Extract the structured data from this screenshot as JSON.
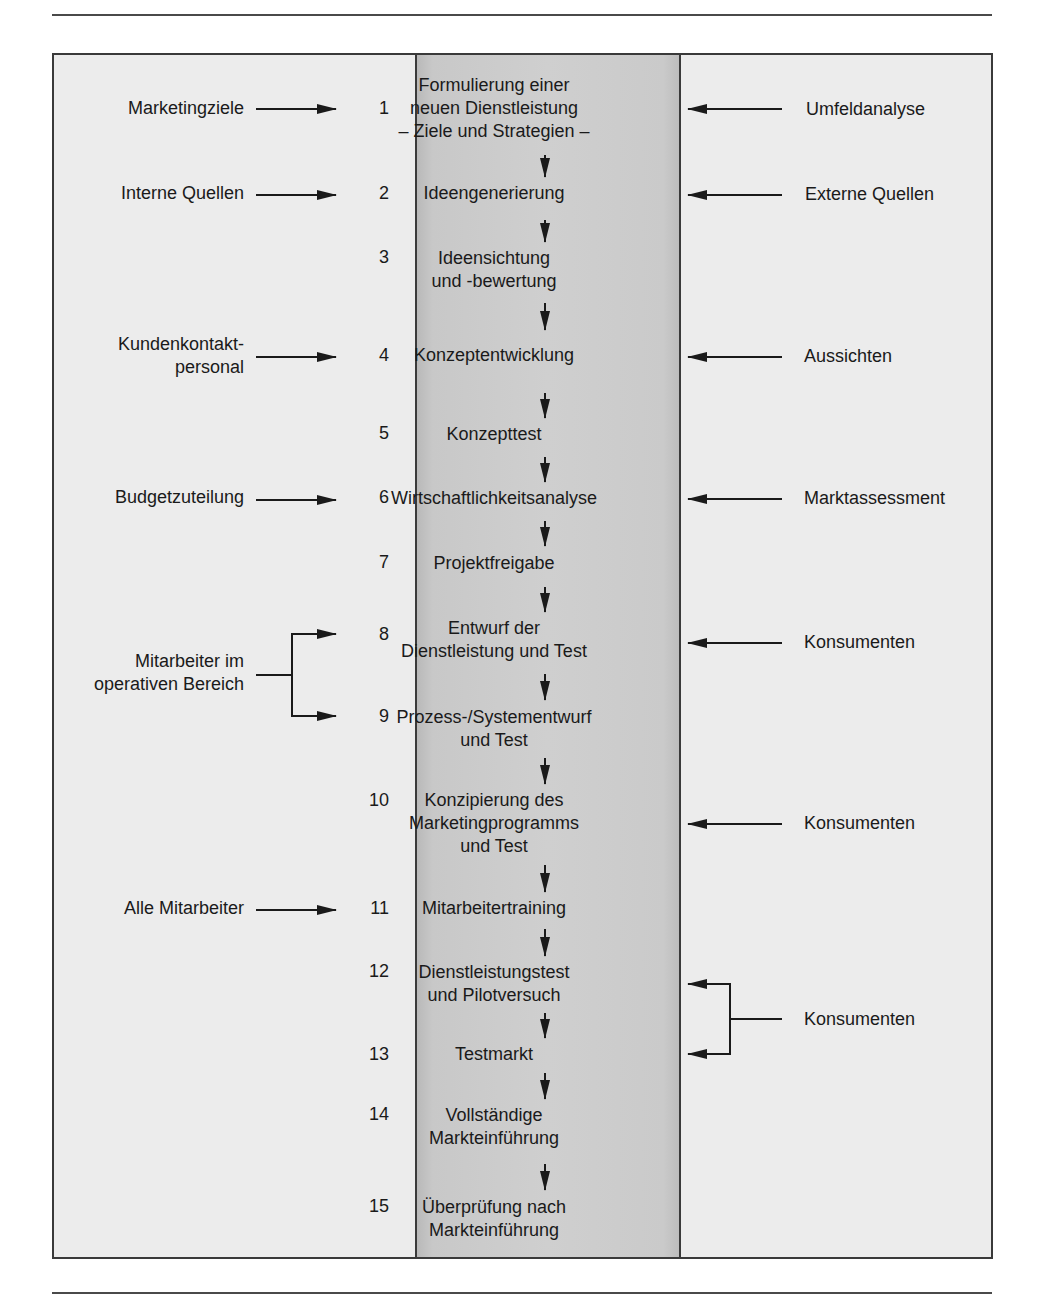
{
  "diagram": {
    "steps": [
      {
        "num": "1",
        "label": [
          "Formulierung einer",
          "neuen Dienstleistung",
          "– Ziele und Strategien –"
        ]
      },
      {
        "num": "2",
        "label": [
          "Ideengenerierung"
        ]
      },
      {
        "num": "3",
        "label": [
          "Ideensichtung",
          "und -bewertung"
        ]
      },
      {
        "num": "4",
        "label": [
          "Konzeptentwicklung"
        ]
      },
      {
        "num": "5",
        "label": [
          "Konzepttest"
        ]
      },
      {
        "num": "6",
        "label": [
          "Wirtschaftlichkeitsanalyse"
        ]
      },
      {
        "num": "7",
        "label": [
          "Projektfreigabe"
        ]
      },
      {
        "num": "8",
        "label": [
          "Entwurf der",
          "Dienstleistung und Test"
        ]
      },
      {
        "num": "9",
        "label": [
          "Prozess-/Systementwurf",
          "und Test"
        ]
      },
      {
        "num": "10",
        "label": [
          "Konzipierung des",
          "Marketingprogramms",
          "und Test"
        ]
      },
      {
        "num": "11",
        "label": [
          "Mitarbeitertraining"
        ]
      },
      {
        "num": "12",
        "label": [
          "Dienstleistungstest",
          "und Pilotversuch"
        ]
      },
      {
        "num": "13",
        "label": [
          "Testmarkt"
        ]
      },
      {
        "num": "14",
        "label": [
          "Vollständige",
          "Markteinführung"
        ]
      },
      {
        "num": "15",
        "label": [
          "Überprüfung nach",
          "Markteinführung"
        ]
      }
    ],
    "left_inputs": [
      {
        "label": [
          "Marketingziele"
        ],
        "targets": [
          "1"
        ]
      },
      {
        "label": [
          "Interne Quellen"
        ],
        "targets": [
          "2"
        ]
      },
      {
        "label": [
          "Kundenkontakt-",
          "personal"
        ],
        "targets": [
          "4"
        ]
      },
      {
        "label": [
          "Budgetzuteilung"
        ],
        "targets": [
          "6"
        ]
      },
      {
        "label": [
          "Mitarbeiter im",
          "operativen Bereich"
        ],
        "targets": [
          "8",
          "9"
        ]
      },
      {
        "label": [
          "Alle Mitarbeiter"
        ],
        "targets": [
          "11"
        ]
      }
    ],
    "right_inputs": [
      {
        "label": [
          "Umfeldanalyse"
        ],
        "targets": [
          "1"
        ]
      },
      {
        "label": [
          "Externe Quellen"
        ],
        "targets": [
          "2"
        ]
      },
      {
        "label": [
          "Aussichten"
        ],
        "targets": [
          "4"
        ]
      },
      {
        "label": [
          "Marktassessment"
        ],
        "targets": [
          "6"
        ]
      },
      {
        "label": [
          "Konsumenten"
        ],
        "targets": [
          "8"
        ]
      },
      {
        "label": [
          "Konsumenten"
        ],
        "targets": [
          "10"
        ]
      },
      {
        "label": [
          "Konsumenten"
        ],
        "targets": [
          "12",
          "13"
        ]
      }
    ]
  },
  "colors": {
    "outer_bg": "#ececec",
    "center_bg": "#cfcfcf",
    "line": "#1a1a1a"
  }
}
